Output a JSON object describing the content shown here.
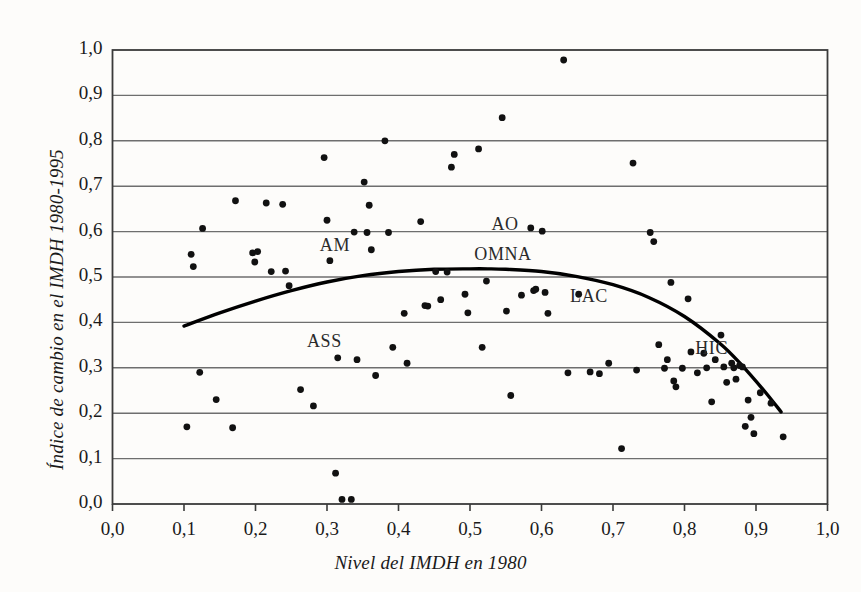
{
  "chart": {
    "type": "scatter",
    "title": "",
    "xlabel": "Nivel del IMDH en 1980",
    "ylabel": "Índice de cambio en el IMDH 1980-1995",
    "xlim": [
      0.0,
      1.0
    ],
    "ylim": [
      0.0,
      1.0
    ],
    "grid": "horizontal",
    "legend_position": "none",
    "xticks": [
      "0,0",
      "0,1",
      "0,2",
      "0,3",
      "0,4",
      "0,5",
      "0,6",
      "0,7",
      "0,8",
      "0,9",
      "1,0"
    ],
    "xtick_values": [
      0.0,
      0.1,
      0.2,
      0.3,
      0.4,
      0.5,
      0.6,
      0.7,
      0.8,
      0.9,
      1.0
    ],
    "yticks": [
      "0,0",
      "0,1",
      "0,2",
      "0,3",
      "0,4",
      "0,5",
      "0,6",
      "0,7",
      "0,8",
      "0,9",
      "1,0"
    ],
    "ytick_values": [
      0.0,
      0.1,
      0.2,
      0.3,
      0.4,
      0.5,
      0.6,
      0.7,
      0.8,
      0.9,
      1.0
    ],
    "marker_color": "#111111",
    "curve_color": "#000000",
    "grid_color": "#6e6e6e",
    "frame_color": "#3a3a3a"
  },
  "chart_data": {
    "type": "scatter",
    "title": "",
    "xlabel": "Nivel del IMDH en 1980",
    "ylabel": "Índice de cambio en el IMDH 1980-1995",
    "xlim": [
      0.0,
      1.0
    ],
    "ylim": [
      0.0,
      1.0
    ],
    "grid": "horizontal gridlines at every 0,1",
    "legend_position": "none",
    "series": [
      {
        "name": "Países",
        "points": [
          [
            0.104,
            0.17
          ],
          [
            0.11,
            0.55
          ],
          [
            0.113,
            0.523
          ],
          [
            0.122,
            0.29
          ],
          [
            0.126,
            0.607
          ],
          [
            0.145,
            0.23
          ],
          [
            0.168,
            0.168
          ],
          [
            0.172,
            0.668
          ],
          [
            0.196,
            0.553
          ],
          [
            0.199,
            0.533
          ],
          [
            0.203,
            0.556
          ],
          [
            0.215,
            0.663
          ],
          [
            0.222,
            0.512
          ],
          [
            0.238,
            0.66
          ],
          [
            0.242,
            0.513
          ],
          [
            0.247,
            0.481
          ],
          [
            0.263,
            0.252
          ],
          [
            0.281,
            0.216
          ],
          [
            0.296,
            0.763
          ],
          [
            0.3,
            0.625
          ],
          [
            0.304,
            0.536
          ],
          [
            0.312,
            0.068
          ],
          [
            0.315,
            0.322
          ],
          [
            0.321,
            0.01
          ],
          [
            0.334,
            0.01
          ],
          [
            0.338,
            0.599
          ],
          [
            0.342,
            0.318
          ],
          [
            0.352,
            0.709
          ],
          [
            0.356,
            0.598
          ],
          [
            0.359,
            0.658
          ],
          [
            0.362,
            0.56
          ],
          [
            0.368,
            0.283
          ],
          [
            0.381,
            0.8
          ],
          [
            0.386,
            0.598
          ],
          [
            0.392,
            0.345
          ],
          [
            0.408,
            0.42
          ],
          [
            0.412,
            0.31
          ],
          [
            0.431,
            0.622
          ],
          [
            0.437,
            0.437
          ],
          [
            0.441,
            0.436
          ],
          [
            0.452,
            0.512
          ],
          [
            0.459,
            0.45
          ],
          [
            0.468,
            0.511
          ],
          [
            0.474,
            0.742
          ],
          [
            0.478,
            0.77
          ],
          [
            0.493,
            0.462
          ],
          [
            0.497,
            0.421
          ],
          [
            0.512,
            0.782
          ],
          [
            0.517,
            0.345
          ],
          [
            0.523,
            0.491
          ],
          [
            0.545,
            0.851
          ],
          [
            0.551,
            0.425
          ],
          [
            0.557,
            0.239
          ],
          [
            0.572,
            0.46
          ],
          [
            0.585,
            0.608
          ],
          [
            0.589,
            0.47
          ],
          [
            0.592,
            0.473
          ],
          [
            0.601,
            0.601
          ],
          [
            0.605,
            0.466
          ],
          [
            0.609,
            0.42
          ],
          [
            0.631,
            0.978
          ],
          [
            0.637,
            0.289
          ],
          [
            0.652,
            0.462
          ],
          [
            0.668,
            0.291
          ],
          [
            0.681,
            0.287
          ],
          [
            0.694,
            0.31
          ],
          [
            0.712,
            0.122
          ],
          [
            0.728,
            0.751
          ],
          [
            0.733,
            0.295
          ],
          [
            0.752,
            0.598
          ],
          [
            0.757,
            0.578
          ],
          [
            0.764,
            0.351
          ],
          [
            0.772,
            0.299
          ],
          [
            0.776,
            0.318
          ],
          [
            0.781,
            0.488
          ],
          [
            0.785,
            0.271
          ],
          [
            0.788,
            0.258
          ],
          [
            0.797,
            0.299
          ],
          [
            0.805,
            0.452
          ],
          [
            0.809,
            0.335
          ],
          [
            0.818,
            0.289
          ],
          [
            0.827,
            0.332
          ],
          [
            0.831,
            0.3
          ],
          [
            0.838,
            0.225
          ],
          [
            0.843,
            0.318
          ],
          [
            0.851,
            0.372
          ],
          [
            0.855,
            0.302
          ],
          [
            0.859,
            0.268
          ],
          [
            0.866,
            0.31
          ],
          [
            0.869,
            0.3
          ],
          [
            0.872,
            0.275
          ],
          [
            0.877,
            0.305
          ],
          [
            0.881,
            0.302
          ],
          [
            0.885,
            0.171
          ],
          [
            0.889,
            0.229
          ],
          [
            0.893,
            0.191
          ],
          [
            0.897,
            0.155
          ],
          [
            0.906,
            0.245
          ],
          [
            0.921,
            0.222
          ],
          [
            0.938,
            0.148
          ]
        ]
      }
    ],
    "trend_curve": {
      "name": "Curva ajustada (cuadrática)",
      "color": "#000000",
      "points": [
        [
          0.1,
          0.392
        ],
        [
          0.15,
          0.421
        ],
        [
          0.2,
          0.447
        ],
        [
          0.25,
          0.47
        ],
        [
          0.3,
          0.489
        ],
        [
          0.35,
          0.503
        ],
        [
          0.4,
          0.512
        ],
        [
          0.45,
          0.517
        ],
        [
          0.5,
          0.518
        ],
        [
          0.525,
          0.518
        ],
        [
          0.55,
          0.517
        ],
        [
          0.6,
          0.512
        ],
        [
          0.65,
          0.501
        ],
        [
          0.7,
          0.483
        ],
        [
          0.75,
          0.455
        ],
        [
          0.8,
          0.413
        ],
        [
          0.85,
          0.353
        ],
        [
          0.88,
          0.306
        ],
        [
          0.91,
          0.252
        ],
        [
          0.935,
          0.203
        ]
      ]
    },
    "annotations": [
      {
        "label": "AM",
        "x": 0.29,
        "y": 0.566
      },
      {
        "label": "ASS",
        "x": 0.272,
        "y": 0.355
      },
      {
        "label": "AO",
        "x": 0.53,
        "y": 0.613
      },
      {
        "label": "OMNA",
        "x": 0.506,
        "y": 0.546
      },
      {
        "label": "LAC",
        "x": 0.64,
        "y": 0.453
      },
      {
        "label": "HIC",
        "x": 0.815,
        "y": 0.339
      }
    ]
  }
}
